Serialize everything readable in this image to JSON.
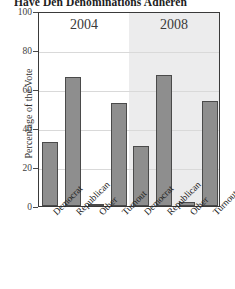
{
  "figure": {
    "title_clipped": "Have Den Denominations Adheren",
    "ylabel": "Percentage of the Vote"
  },
  "axis": {
    "yticks": [
      "100",
      "80",
      "60",
      "40",
      "20",
      "0"
    ],
    "panel_labels": [
      "2004",
      "2008"
    ]
  },
  "chart_data": {
    "type": "bar",
    "title": "Have Den Denominations Adheren",
    "xlabel": "",
    "ylabel": "Percentage of the Vote",
    "ylim": [
      0,
      100
    ],
    "yticks": [
      0,
      20,
      40,
      60,
      80,
      100
    ],
    "grid": true,
    "legend": "none",
    "panels": [
      {
        "name": "2004",
        "categories": [
          "Democrat",
          "Republican",
          "Other",
          "Turnout"
        ],
        "values": [
          33,
          66,
          1,
          53
        ]
      },
      {
        "name": "2008",
        "categories": [
          "Democrat",
          "Republican",
          "Other",
          "Turnout"
        ],
        "values": [
          31,
          67,
          2,
          54
        ]
      }
    ],
    "bar_color": "#8e8e8e",
    "bar_edge_color": "#4a4a4a"
  }
}
